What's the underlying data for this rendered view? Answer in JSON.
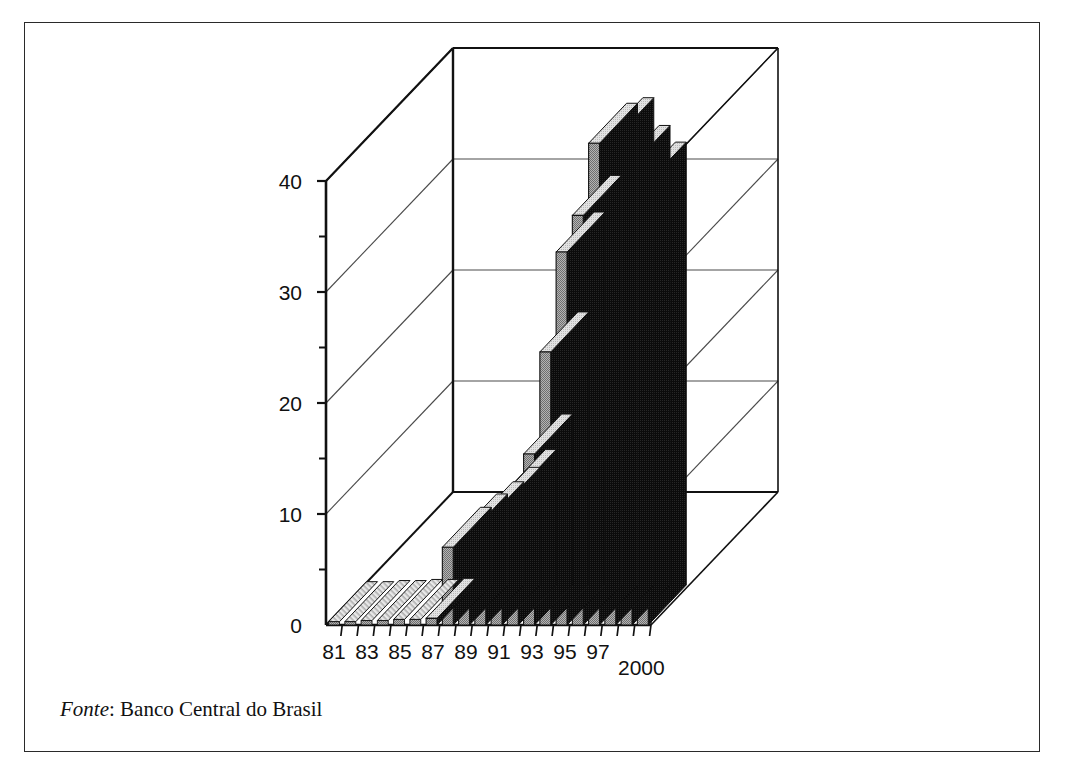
{
  "figure": {
    "source_label": "Fonte",
    "source_separator": ": ",
    "source_text": "Banco Central do Brasil",
    "frame_color": "#2a2a2a",
    "background_color": "#ffffff"
  },
  "chart_data": {
    "type": "bar",
    "title": "",
    "subtitle": "",
    "xlabel": "",
    "ylabel": "",
    "legend": [],
    "grid": true,
    "grid_axis": "y",
    "legend_position": "none",
    "projection": "3d",
    "ylim": [
      0,
      45
    ],
    "yticks": [
      0,
      10,
      20,
      30,
      40
    ],
    "ytick_labels": [
      "0",
      "10",
      "20",
      "30",
      "40"
    ],
    "yticks_minor": [
      5,
      15,
      25,
      35
    ],
    "gridlines": [
      10,
      20,
      30,
      40
    ],
    "x_axis_end_label": "2000",
    "categories": [
      "81",
      "82",
      "83",
      "84",
      "85",
      "86",
      "87",
      "88",
      "89",
      "90",
      "91",
      "92",
      "93",
      "94",
      "95",
      "96",
      "97",
      "98",
      "99",
      "2000"
    ],
    "xtick_labels_shown": [
      "81",
      "83",
      "85",
      "87",
      "89",
      "91",
      "93",
      "95",
      "97"
    ],
    "values": [
      0.3,
      0.3,
      0.4,
      0.4,
      0.5,
      0.5,
      0.6,
      7.0,
      8.2,
      9.3,
      10.6,
      12.2,
      15.4,
      24.6,
      33.6,
      36.9,
      43.4,
      43.9,
      41.4,
      39.9
    ],
    "colors": {
      "bar_front": "#9b9b9b",
      "bar_top": "#d9d9d9",
      "bar_side": "#0a0a0a",
      "bar_outline": "#111111",
      "wall_line": "#111111",
      "gridline": "#4a4a4a",
      "floor": "#ffffff"
    }
  },
  "axes": {
    "y_tick_labels": [
      {
        "text": "40"
      },
      {
        "text": "30"
      },
      {
        "text": "20"
      },
      {
        "text": "10"
      },
      {
        "text": "0"
      }
    ],
    "x_tick_labels": [
      {
        "text": "81"
      },
      {
        "text": "83"
      },
      {
        "text": "85"
      },
      {
        "text": "87"
      },
      {
        "text": "89"
      },
      {
        "text": "91"
      },
      {
        "text": "93"
      },
      {
        "text": "95"
      },
      {
        "text": "97"
      }
    ],
    "x_end_label": "2000"
  }
}
